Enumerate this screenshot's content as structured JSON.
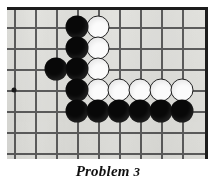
{
  "figure": {
    "kind": "go-board-diagram",
    "caption_text": "Problem",
    "caption_number": "3",
    "board": {
      "background_color": "#e2e2de",
      "line_color": "#5d5d5d",
      "border_color": "#1c1c1c",
      "grid_origin_x": 14,
      "grid_origin_y": 24,
      "grid_spacing": 21,
      "columns": 9,
      "rows": 7,
      "vertical_line_x": [
        14,
        35,
        56,
        77,
        98,
        119,
        140,
        161,
        182
      ],
      "horizontal_line_y": [
        24,
        45,
        66,
        87,
        108,
        129,
        150
      ],
      "star_points": [
        {
          "col": 0,
          "row": 3
        }
      ]
    },
    "stones": [
      {
        "color": "black",
        "col": 3,
        "row": 0
      },
      {
        "color": "white",
        "col": 4,
        "row": 0
      },
      {
        "color": "black",
        "col": 3,
        "row": 1
      },
      {
        "color": "white",
        "col": 4,
        "row": 1
      },
      {
        "color": "black",
        "col": 2,
        "row": 2
      },
      {
        "color": "black",
        "col": 3,
        "row": 2
      },
      {
        "color": "white",
        "col": 4,
        "row": 2
      },
      {
        "color": "black",
        "col": 3,
        "row": 3
      },
      {
        "color": "white",
        "col": 4,
        "row": 3
      },
      {
        "color": "white",
        "col": 5,
        "row": 3
      },
      {
        "color": "white",
        "col": 6,
        "row": 3
      },
      {
        "color": "white",
        "col": 7,
        "row": 3
      },
      {
        "color": "white",
        "col": 8,
        "row": 3
      },
      {
        "color": "black",
        "col": 3,
        "row": 4
      },
      {
        "color": "black",
        "col": 4,
        "row": 4
      },
      {
        "color": "black",
        "col": 5,
        "row": 4
      },
      {
        "color": "black",
        "col": 6,
        "row": 4
      },
      {
        "color": "black",
        "col": 7,
        "row": 4
      },
      {
        "color": "black",
        "col": 8,
        "row": 4
      }
    ],
    "stone_colors": {
      "black": "#080808",
      "white": "#fbfbfb"
    }
  }
}
